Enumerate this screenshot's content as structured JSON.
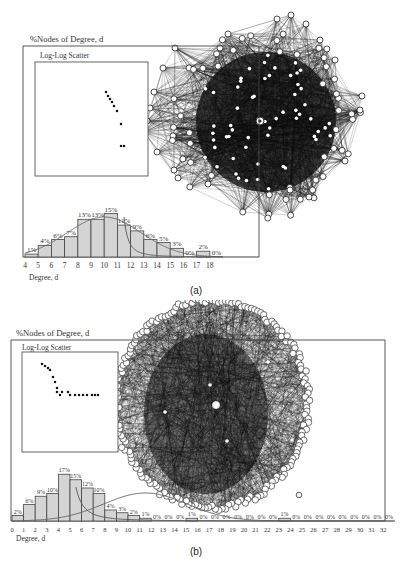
{
  "figure": {
    "panels": [
      {
        "id": "a",
        "caption": "(a)",
        "y_title": "%Nodes of Degree, d",
        "x_title": "Degree, d",
        "inset_title": "Log-Log Scatter"
      },
      {
        "id": "b",
        "caption": "(b)",
        "y_title": "%Nodes of Degree, d",
        "x_title": "Degree, d",
        "inset_title": "Log-Log Scatter"
      }
    ]
  },
  "chart_data": [
    {
      "type": "bar",
      "panel": "(a)",
      "title": "%Nodes of Degree, d",
      "xlabel": "Degree, d",
      "ylabel": "%Nodes of Degree, d",
      "categories": [
        "4",
        "5",
        "6",
        "7",
        "8",
        "9",
        "10",
        "11",
        "12",
        "13",
        "14",
        "15",
        "16",
        "17",
        "18"
      ],
      "values": [
        1,
        4,
        6,
        7,
        13,
        13,
        15,
        11,
        9,
        6,
        5,
        3,
        0,
        2,
        0
      ],
      "labels": [
        "1%",
        "4%",
        "6%",
        "7%",
        "13%",
        "13%",
        "15%",
        "11%",
        "9%",
        "6%",
        "5%",
        "3%",
        "0%",
        "2%",
        "0%"
      ],
      "overlay_curves": [
        "fitted bell curve",
        "power-law decay curve"
      ],
      "inset": {
        "type": "scatter",
        "title": "Log-Log Scatter",
        "points_px": [
          [
            106,
            92
          ],
          [
            108,
            96
          ],
          [
            110,
            99
          ],
          [
            112,
            102
          ],
          [
            114,
            106
          ],
          [
            117,
            111
          ],
          [
            121,
            124
          ],
          [
            121,
            146
          ],
          [
            124,
            146
          ]
        ]
      },
      "background_graph": "dense random network (node-link diagram) with ~100 circular nodes"
    },
    {
      "type": "bar",
      "panel": "(b)",
      "title": "%Nodes of Degree, d",
      "xlabel": "Degree, d",
      "ylabel": "%Nodes of Degree, d",
      "categories": [
        "0",
        "1",
        "2",
        "3",
        "4",
        "5",
        "6",
        "7",
        "8",
        "9",
        "10",
        "11",
        "12",
        "13",
        "14",
        "15",
        "16",
        "17",
        "18",
        "19",
        "20",
        "21",
        "22",
        "23",
        "24",
        "25",
        "26",
        "27",
        "28",
        "29",
        "30",
        "31",
        "32"
      ],
      "values": [
        2,
        6,
        9,
        10,
        17,
        15,
        12,
        10,
        4,
        3,
        2,
        1,
        0,
        0,
        0,
        1,
        0,
        0,
        0,
        0,
        0,
        0,
        0,
        1,
        0,
        0,
        0,
        0,
        0,
        0,
        0,
        0,
        0
      ],
      "labels": [
        "2%",
        "6%",
        "9%",
        "10%",
        "17%",
        "15%",
        "12%",
        "10%",
        "4%",
        "3%",
        "2%",
        "1%",
        "0%",
        "0%",
        "0%",
        "1%",
        "0%",
        "0%",
        "0%",
        "0%",
        "0%",
        "0%",
        "0%",
        "1%",
        "0%",
        "0%",
        "0%",
        "0%",
        "0%",
        "0%",
        "0%",
        "0%",
        "0%"
      ],
      "overlay_curves": [
        "fitted bell curve",
        "power-law decay curve"
      ],
      "inset": {
        "type": "scatter",
        "title": "Log-Log Scatter",
        "points_px": [
          [
            42,
            364
          ],
          [
            45,
            366
          ],
          [
            48,
            368
          ],
          [
            50,
            370
          ],
          [
            53,
            377
          ],
          [
            55,
            382
          ],
          [
            57,
            388
          ],
          [
            57,
            392
          ],
          [
            62,
            392
          ],
          [
            68,
            392
          ],
          [
            70,
            395
          ],
          [
            60,
            395
          ],
          [
            75,
            395
          ],
          [
            79,
            395
          ],
          [
            83,
            395
          ],
          [
            87,
            395
          ],
          [
            92,
            395
          ],
          [
            95,
            395
          ],
          [
            98,
            395
          ]
        ]
      },
      "background_graph": "dense scale-free network (node-link diagram) with hundreds of circular nodes on a circle"
    }
  ]
}
